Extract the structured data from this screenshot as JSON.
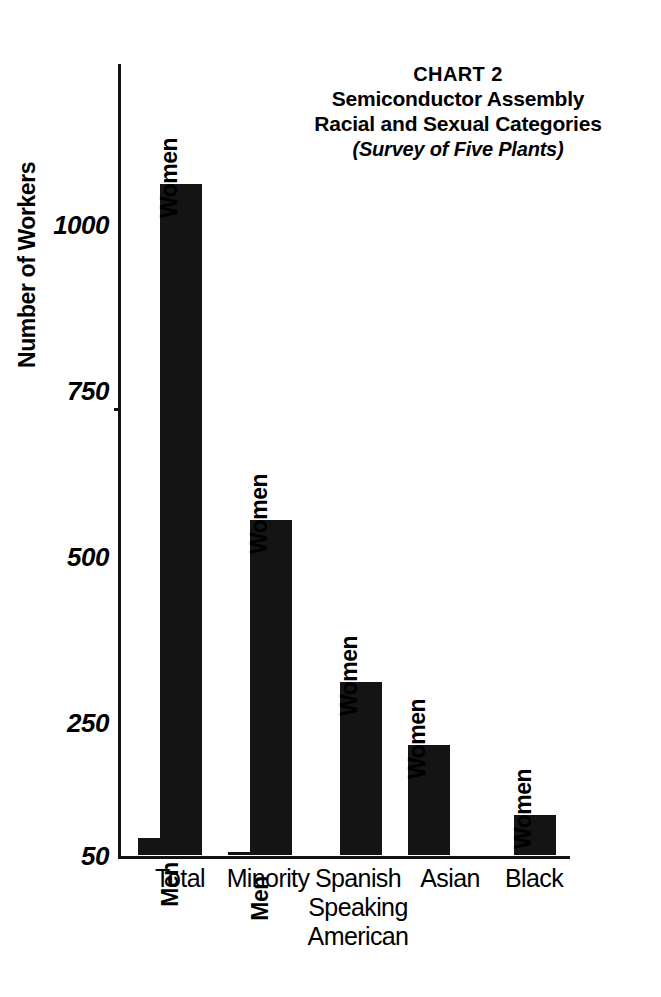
{
  "title": {
    "chart_number": "CHART 2",
    "line1": "Semiconductor Assembly",
    "line2": "Racial and Sexual Categories",
    "subtitle": "(Survey of Five Plants)"
  },
  "axes": {
    "ylabel": "Number of Workers",
    "y_ticks": [
      "1000",
      "750",
      "500",
      "250",
      "50"
    ]
  },
  "series_labels": {
    "men": "Men",
    "women": "Women"
  },
  "categories_display": [
    "Total",
    "Minority",
    "Spanish\nSpeaking\nAmerican",
    "Asian",
    "Black"
  ],
  "colors": {
    "bar": "#141414",
    "axis": "#111111",
    "background": "#ffffff",
    "text": "#000000"
  },
  "chart_data": {
    "type": "bar",
    "subtitle": "(Survey of Five Plants)",
    "xlabel": "",
    "ylabel": "Number of Workers",
    "ylim": [
      50,
      1100
    ],
    "ytick_values": [
      1000,
      750,
      500,
      250,
      50
    ],
    "grid": false,
    "legend": "none (bars labelled in place)",
    "categories": [
      "Total",
      "Minority",
      "Spanish Speaking American",
      "Asian",
      "Black"
    ],
    "series": [
      {
        "name": "Men",
        "values": [
          75,
          55,
          45,
          0,
          50
        ]
      },
      {
        "name": "Women",
        "values": [
          1060,
          555,
          310,
          215,
          110
        ]
      }
    ],
    "bars": [
      {
        "category": "Total",
        "group": "Men",
        "value": 75,
        "label": "Men"
      },
      {
        "category": "Total",
        "group": "Women",
        "value": 1060,
        "label": "Women"
      },
      {
        "category": "Minority",
        "group": "Men",
        "value": 55,
        "label": "Men"
      },
      {
        "category": "Minority",
        "group": "Women",
        "value": 555,
        "label": "Women"
      },
      {
        "category": "Spanish Speaking American",
        "group": "Men",
        "value": 45,
        "label": "Men"
      },
      {
        "category": "Spanish Speaking American",
        "group": "Women",
        "value": 310,
        "label": "Women"
      },
      {
        "category": "Asian",
        "group": "Men",
        "value": 0,
        "label": ""
      },
      {
        "category": "Asian",
        "group": "Women",
        "value": 215,
        "label": "Women"
      },
      {
        "category": "Black",
        "group": "Men",
        "value": 50,
        "label": "Men"
      },
      {
        "category": "Black",
        "group": "Women",
        "value": 110,
        "label": "Women"
      }
    ]
  },
  "geometry": {
    "baseline_px": 792,
    "px_per_unit": 0.664,
    "base_value": 50,
    "bar_width_px": 42,
    "groups": [
      {
        "category": "Total",
        "men_x": 20,
        "women_x": 42,
        "label_x": -2,
        "label_w": 128
      },
      {
        "category": "Minority",
        "men_x": 110,
        "women_x": 132,
        "label_x": 86,
        "label_w": 128
      },
      {
        "category": "Spanish Speaking American",
        "men_x": 200,
        "women_x": 222,
        "label_x": 176,
        "label_w": 128
      },
      {
        "category": "Asian",
        "men_x": 290,
        "women_x": 290,
        "label_x": 268,
        "label_w": 128
      },
      {
        "category": "Black",
        "men_x": 374,
        "women_x": 396,
        "label_x": 352,
        "label_w": 128
      }
    ]
  }
}
